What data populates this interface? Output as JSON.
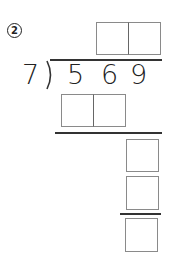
{
  "problem": {
    "number_label": "2",
    "divisor": "7",
    "dividend_digits": [
      "5",
      "6",
      "9"
    ]
  },
  "answer_boxes": {
    "quotient": [
      "",
      ""
    ],
    "first_product": [
      "",
      ""
    ],
    "remainder_step": [
      "",
      ""
    ],
    "final_remainder": [
      ""
    ]
  },
  "colors": {
    "line": "#333333",
    "box_border": "#8a8a8a",
    "text": "#222222"
  }
}
